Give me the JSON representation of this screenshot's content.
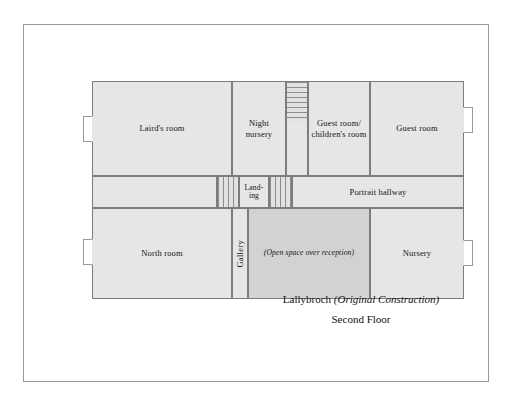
{
  "figure": {
    "caption_line1_main": "Lallybroch",
    "caption_line1_paren": "(Original Construction)",
    "caption_line2": "Second Floor"
  },
  "plan": {
    "upper_floor_rooms": [
      {
        "id": "lairds-room",
        "label": "Laird's room"
      },
      {
        "id": "night-nursery",
        "label": "Night\nnursery"
      },
      {
        "id": "guest-children",
        "label": "Guest room/\nchildren's room"
      },
      {
        "id": "guest-room",
        "label": "Guest room"
      }
    ],
    "middle_band": [
      {
        "id": "landing",
        "label": "Land-\ning"
      },
      {
        "id": "portrait-hallway",
        "label": "Portrait hallway"
      }
    ],
    "lower_floor_rooms": [
      {
        "id": "north-room",
        "label": "North room"
      },
      {
        "id": "gallery",
        "label": "Gallery"
      },
      {
        "id": "open-space",
        "label": "(Open space over reception)"
      },
      {
        "id": "nursery",
        "label": "Nursery"
      }
    ],
    "blank_rooms": [
      {
        "id": "hall-west-blank"
      }
    ],
    "stairs": [
      {
        "id": "stair-run-upper",
        "orientation": "horizontal"
      },
      {
        "id": "stair-landing-west",
        "orientation": "vertical"
      },
      {
        "id": "stair-landing-east",
        "orientation": "vertical"
      }
    ],
    "windows": [
      {
        "id": "window-lairds-room-west"
      },
      {
        "id": "window-north-room-west"
      },
      {
        "id": "window-guest-room-east"
      },
      {
        "id": "window-nursery-east"
      }
    ]
  },
  "colors": {
    "room_fill": "#e6e6e6",
    "shaded_fill": "#d2d2d2",
    "wall_stroke": "#7d7d7d",
    "frame_stroke": "#9a9a9a",
    "text": "#141414",
    "page_background": "#ffffff"
  }
}
